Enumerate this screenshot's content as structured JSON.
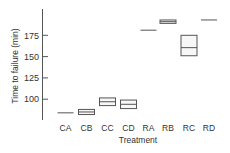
{
  "chart_data": {
    "type": "box",
    "title": "",
    "xlabel": "Treatment",
    "ylabel": "Time to failure (min)",
    "categories": [
      "CA",
      "CB",
      "CC",
      "CD",
      "RA",
      "RB",
      "RC",
      "RD"
    ],
    "yticks": [
      100,
      125,
      150,
      175
    ],
    "ylim": [
      75,
      205
    ],
    "grid": false,
    "legend": null,
    "boxes": [
      {
        "label": "CA",
        "q1": 84,
        "median": 84,
        "q3": 84
      },
      {
        "label": "CB",
        "q1": 82,
        "median": 85,
        "q3": 88
      },
      {
        "label": "CC",
        "q1": 92.5,
        "median": 97,
        "q3": 101.5
      },
      {
        "label": "CD",
        "q1": 89,
        "median": 94,
        "q3": 99
      },
      {
        "label": "RA",
        "q1": 181,
        "median": 181,
        "q3": 181
      },
      {
        "label": "RB",
        "q1": 189,
        "median": 191,
        "q3": 193
      },
      {
        "label": "RC",
        "q1": 151,
        "median": 160.5,
        "q3": 175
      },
      {
        "label": "RD",
        "q1": 193,
        "median": 193,
        "q3": 193
      }
    ]
  }
}
